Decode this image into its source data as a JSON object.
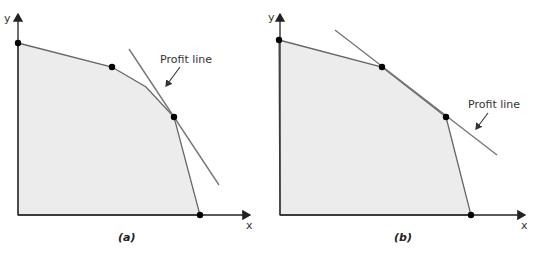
{
  "panels": [
    {
      "id": "a",
      "caption": "(a)",
      "axis_x_label": "x",
      "axis_y_label": "y",
      "profit_line_label": "Profit line",
      "description": "Profit line touches feasible region at a single corner point"
    },
    {
      "id": "b",
      "caption": "(b)",
      "axis_x_label": "x",
      "axis_y_label": "y",
      "profit_line_label": "Profit line",
      "description": "Profit line coincides with an edge of the feasible region (two corner points)"
    }
  ],
  "colors": {
    "region_fill": "#ececec",
    "edge": "#666666",
    "axis": "#222222",
    "vertex": "#000000"
  }
}
